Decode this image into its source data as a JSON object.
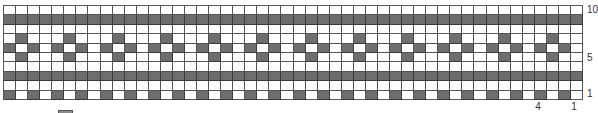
{
  "chart": {
    "title": "",
    "type": "knitting-colorwork-chart",
    "columns": 48,
    "rows": 10,
    "repeat_width": 4,
    "colors": {
      "background": "#ffffff",
      "contrast": "#6e6e6e",
      "grid_line": "#555555"
    },
    "row_labels": [
      {
        "text": "10",
        "row": 10
      },
      {
        "text": "5",
        "row": 5
      },
      {
        "text": "1",
        "row": 1
      }
    ],
    "col_labels": [
      {
        "text": "4",
        "col": 4
      },
      {
        "text": "1",
        "col": 1
      }
    ],
    "pattern_rows_top_to_bottom": [
      {
        "row": 10,
        "repeat": [
          0,
          0,
          0,
          0
        ]
      },
      {
        "row": 9,
        "repeat": [
          1,
          1,
          1,
          1
        ]
      },
      {
        "row": 8,
        "repeat": [
          0,
          0,
          0,
          0
        ]
      },
      {
        "row": 7,
        "repeat": [
          0,
          1,
          0,
          0
        ]
      },
      {
        "row": 6,
        "repeat": [
          1,
          0,
          1,
          0
        ]
      },
      {
        "row": 5,
        "repeat": [
          0,
          1,
          0,
          0
        ]
      },
      {
        "row": 4,
        "repeat": [
          0,
          0,
          0,
          0
        ]
      },
      {
        "row": 3,
        "repeat": [
          1,
          1,
          1,
          1
        ]
      },
      {
        "row": 2,
        "repeat": [
          0,
          0,
          0,
          0
        ]
      },
      {
        "row": 1,
        "repeat": [
          1,
          0,
          1,
          0
        ]
      }
    ]
  },
  "labels": {
    "row_10": "10",
    "row_5": "5",
    "row_1": "1",
    "col_4": "4",
    "col_1": "1"
  }
}
